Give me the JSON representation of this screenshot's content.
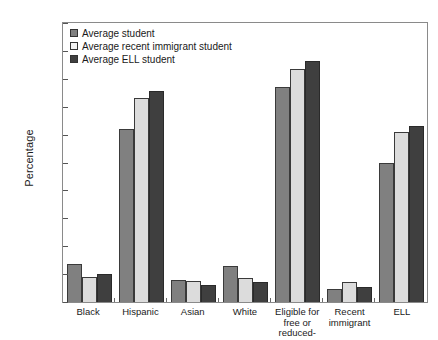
{
  "chart_data": {
    "type": "bar",
    "title": "",
    "xlabel": "",
    "ylabel": "Percentage",
    "ylim": [
      0,
      100
    ],
    "ytick_step": 10,
    "yticks": [
      0,
      10,
      20,
      30,
      40,
      50,
      60,
      70,
      80,
      90,
      100
    ],
    "grid": false,
    "legend_position": "top-left",
    "categories": [
      "Black",
      "Hispanic",
      "Asian",
      "White",
      "Eligible for free or reduced-price lunch",
      "Recent immigrant",
      "ELL"
    ],
    "series": [
      {
        "name": "Average student",
        "color": "#808080",
        "values": [
          13.5,
          62,
          8,
          13,
          77,
          4.5,
          50
        ]
      },
      {
        "name": "Average recent immigrant student",
        "color": "#dcdcdc",
        "values": [
          9,
          73,
          7.5,
          8.5,
          83.5,
          7,
          61
        ]
      },
      {
        "name": "Average ELL student",
        "color": "#3f3f3f",
        "values": [
          10,
          75.5,
          6,
          7,
          86.5,
          5.5,
          63
        ]
      }
    ]
  },
  "axis": {
    "y_title": "Percentage"
  }
}
